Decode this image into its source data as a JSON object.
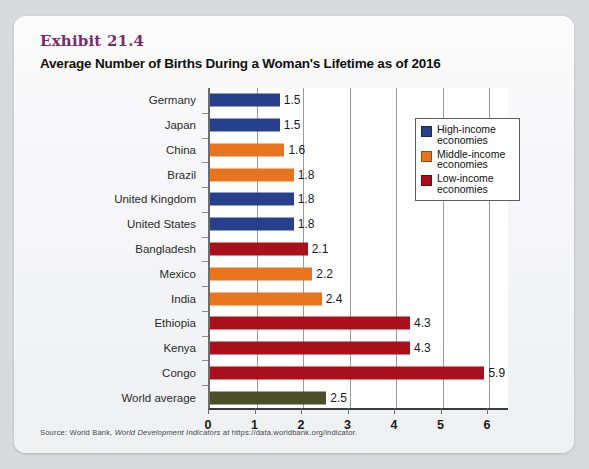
{
  "exhibit": {
    "label": "Exhibit 21.4",
    "title": "Average Number of Births During a Woman's Lifetime as of 2016"
  },
  "source": {
    "prefix": "Source: World Bank, ",
    "italic": "World Development Indicators",
    "suffix": " at https://data.worldbank.org/indicator."
  },
  "legend": {
    "items": [
      {
        "label": "High-income economies",
        "color": "#27408b"
      },
      {
        "label": "Middle-income economies",
        "color": "#e8741e"
      },
      {
        "label": "Low-income economies",
        "color": "#a8101c"
      }
    ]
  },
  "colors": {
    "high_income": "#27408b",
    "middle_income": "#e8741e",
    "low_income": "#a8101c",
    "world_average": "#4a4f2a",
    "exhibit_label": "#7b2d6b",
    "plot_background": "#ffffff",
    "card_background": "#f6f6f8",
    "page_background": "#d8dade"
  },
  "chart_data": {
    "type": "bar",
    "orientation": "horizontal",
    "title": "Average Number of Births During a Woman's Lifetime as of 2016",
    "xlabel": "",
    "ylabel": "",
    "xlim": [
      0,
      6.45
    ],
    "xticks": [
      0,
      1,
      2,
      3,
      4,
      5,
      6
    ],
    "grid": true,
    "legend_position": "upper right (inside plot)",
    "categories": [
      "Germany",
      "Japan",
      "China",
      "Brazil",
      "United Kingdom",
      "United States",
      "Bangladesh",
      "Mexico",
      "India",
      "Ethiopia",
      "Kenya",
      "Congo",
      "World average"
    ],
    "values": [
      1.5,
      1.5,
      1.6,
      1.8,
      1.8,
      1.8,
      2.1,
      2.2,
      2.4,
      4.3,
      4.3,
      5.9,
      2.5
    ],
    "value_labels": [
      "1.5",
      "1.5",
      "1.6",
      "1.8",
      "1.8",
      "1.8",
      "2.1",
      "2.2",
      "2.4",
      "4.3",
      "4.3",
      "5.9",
      "2.5"
    ],
    "groups": [
      "High-income",
      "High-income",
      "Middle-income",
      "Middle-income",
      "High-income",
      "High-income",
      "Low-income",
      "Middle-income",
      "Middle-income",
      "Low-income",
      "Low-income",
      "Low-income",
      "World average"
    ],
    "bar_colors": [
      "#27408b",
      "#27408b",
      "#e8741e",
      "#e8741e",
      "#27408b",
      "#27408b",
      "#a8101c",
      "#e8741e",
      "#e8741e",
      "#a8101c",
      "#a8101c",
      "#a8101c",
      "#4a4f2a"
    ]
  },
  "bleed": [
    {
      "text": "THE ECONOMY",
      "x": 52,
      "y": 193,
      "size": 15
    },
    {
      "text": "Introduction",
      "x": 52,
      "y": 168,
      "size": 11
    },
    {
      "text": "population growth",
      "x": 300,
      "y": 28,
      "size": 10
    },
    {
      "text": "demographic transition",
      "x": 300,
      "y": 44,
      "size": 10
    }
  ]
}
